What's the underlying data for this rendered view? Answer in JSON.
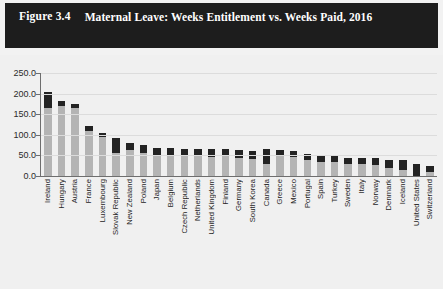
{
  "header": {
    "figure_label": "Figure 3.4",
    "title": "Maternal Leave: Weeks Entitlement vs. Weeks Paid, 2016"
  },
  "colors": {
    "title_bar_bg": "#1d1d1d",
    "title_text": "#ffffff",
    "chart_bg": "#f0f0f0",
    "weeks_paid_bar": "#b4b4b4",
    "weeks_entitlement_bar": "#232323",
    "axis": "#6e6e6e",
    "gridline": "#dcdcdc"
  },
  "chart_data": {
    "type": "bar",
    "title": "Maternal Leave: Weeks Entitlement vs. Weeks Paid, 2016",
    "xlabel": "",
    "ylabel": "",
    "ylim": [
      0,
      250
    ],
    "yticks": [
      "0.0",
      "50.0",
      "100.0",
      "150.0",
      "200.0",
      "250.0"
    ],
    "ytick_values": [
      0,
      50,
      100,
      150,
      200,
      250
    ],
    "grid": true,
    "legend_position": "none",
    "stacked": true,
    "categories": [
      "Ireland",
      "Hungary",
      "Austria",
      "France",
      "Luxembourg",
      "Slovak Republic",
      "New Zealand",
      "Poland",
      "Japan",
      "Belgium",
      "Czech Republic",
      "Netherlands",
      "United Kingdom",
      "Finland",
      "Germany",
      "South Korea",
      "Canada",
      "Greece",
      "Mexico",
      "Portugal",
      "Spain",
      "Turkey",
      "Sweden",
      "Italy",
      "Norway",
      "Denmark",
      "Iceland",
      "United States",
      "Switzerland"
    ],
    "series": [
      {
        "name": "Weeks Paid",
        "values": [
          166,
          170,
          164,
          110,
          95,
          57,
          64,
          57,
          51,
          49,
          48,
          52,
          46,
          48,
          44,
          42,
          30,
          50,
          47,
          39,
          35,
          34,
          30,
          29,
          26,
          20,
          14,
          0,
          10
        ]
      },
      {
        "name": "Weeks Entitlement",
        "values": [
          205,
          183,
          175,
          122,
          105,
          92,
          81,
          75,
          68,
          68,
          66,
          65,
          66,
          66,
          62,
          61,
          65,
          64,
          61,
          54,
          52,
          48,
          44,
          44,
          44,
          40,
          38,
          30,
          24
        ]
      }
    ]
  }
}
